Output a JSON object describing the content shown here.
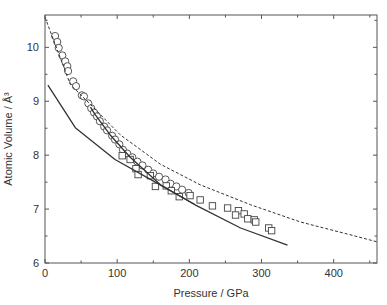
{
  "chart_data": {
    "type": "scatter",
    "title": "",
    "xlabel": "Pressure / GPa",
    "ylabel": "Atomic Volume / Å³",
    "xlim": [
      0,
      460
    ],
    "ylim": [
      6,
      10.6
    ],
    "xticks": [
      0,
      100,
      200,
      300,
      400
    ],
    "xminor": [
      50,
      150,
      250,
      350,
      450
    ],
    "yticks": [
      6,
      7,
      8,
      9,
      10
    ],
    "yminor": [
      6.5,
      7.5,
      8.5,
      9.5,
      10.5
    ],
    "grid": false,
    "legend": "none",
    "series": [
      {
        "name": "circles",
        "kind": "markers",
        "marker": "circle",
        "points": [
          [
            14,
            10.21
          ],
          [
            17,
            10.1
          ],
          [
            19,
            9.99
          ],
          [
            24,
            9.85
          ],
          [
            28,
            9.74
          ],
          [
            31,
            9.65
          ],
          [
            32,
            9.56
          ],
          [
            39,
            9.37
          ],
          [
            43,
            9.28
          ],
          [
            51,
            9.11
          ],
          [
            54,
            9.09
          ],
          [
            60,
            8.96
          ],
          [
            64,
            8.87
          ],
          [
            68,
            8.79
          ],
          [
            72,
            8.72
          ],
          [
            76,
            8.63
          ],
          [
            82,
            8.53
          ],
          [
            86,
            8.46
          ],
          [
            93,
            8.36
          ],
          [
            97,
            8.29
          ],
          [
            103,
            8.2
          ],
          [
            108,
            8.1
          ],
          [
            114,
            8.03
          ],
          [
            121,
            7.96
          ],
          [
            128,
            7.88
          ],
          [
            135,
            7.81
          ],
          [
            143,
            7.73
          ],
          [
            150,
            7.66
          ],
          [
            158,
            7.6
          ],
          [
            167,
            7.55
          ],
          [
            174,
            7.47
          ],
          [
            182,
            7.42
          ],
          [
            190,
            7.36
          ],
          [
            199,
            7.3
          ]
        ]
      },
      {
        "name": "squares",
        "kind": "markers",
        "marker": "square",
        "points": [
          [
            107,
            7.99
          ],
          [
            118,
            7.92
          ],
          [
            126,
            7.75
          ],
          [
            129,
            7.64
          ],
          [
            146,
            7.62
          ],
          [
            153,
            7.42
          ],
          [
            168,
            7.43
          ],
          [
            175,
            7.34
          ],
          [
            186,
            7.23
          ],
          [
            201,
            7.25
          ],
          [
            215,
            7.17
          ],
          [
            232,
            7.06
          ],
          [
            253,
            7.02
          ],
          [
            268,
            6.97
          ],
          [
            264,
            6.89
          ],
          [
            276,
            6.91
          ],
          [
            281,
            6.82
          ],
          [
            290,
            6.8
          ],
          [
            292,
            6.76
          ],
          [
            310,
            6.65
          ],
          [
            314,
            6.6
          ]
        ]
      },
      {
        "name": "dashed-curve",
        "kind": "line",
        "style": "dashed",
        "points": [
          [
            0,
            10.56
          ],
          [
            14,
            10.06
          ],
          [
            35,
            9.31
          ],
          [
            63,
            8.94
          ],
          [
            104,
            8.38
          ],
          [
            160,
            7.83
          ],
          [
            215,
            7.45
          ],
          [
            285,
            7.08
          ],
          [
            354,
            6.76
          ],
          [
            424,
            6.52
          ],
          [
            461,
            6.39
          ]
        ]
      },
      {
        "name": "solid-curve-lower",
        "kind": "line",
        "style": "solid",
        "points": [
          [
            4,
            9.3
          ],
          [
            42,
            8.51
          ],
          [
            97,
            7.92
          ],
          [
            146,
            7.55
          ],
          [
            208,
            7.08
          ],
          [
            271,
            6.65
          ],
          [
            336,
            6.33
          ]
        ]
      },
      {
        "name": "solid-curve-upper",
        "kind": "line",
        "style": "solid",
        "points": [
          [
            63,
            8.89
          ],
          [
            69,
            8.76
          ],
          [
            90,
            8.38
          ],
          [
            118,
            7.96
          ],
          [
            160,
            7.45
          ],
          [
            208,
            7.08
          ]
        ]
      }
    ]
  }
}
